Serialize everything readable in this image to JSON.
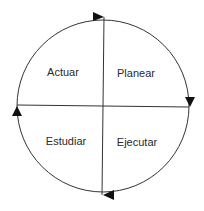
{
  "diagram": {
    "type": "PDSA cycle",
    "quadrants": [
      {
        "id": "top-left",
        "label": "Actuar"
      },
      {
        "id": "top-right",
        "label": "Planear"
      },
      {
        "id": "bottom-right",
        "label": "Ejecutar"
      },
      {
        "id": "bottom-left",
        "label": "Estudiar"
      }
    ],
    "direction": "clockwise",
    "colors": {
      "stroke": "#333333",
      "text": "#2a2a2a",
      "background": "#ffffff"
    }
  }
}
